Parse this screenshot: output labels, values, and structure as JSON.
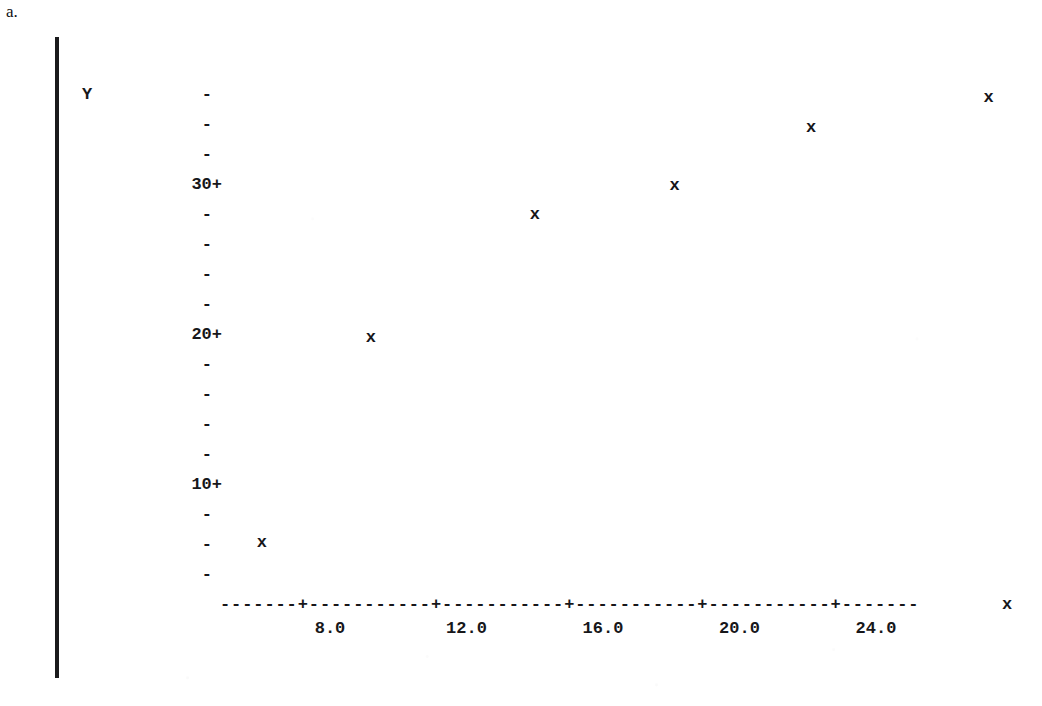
{
  "figure": {
    "panel_label": "a.",
    "y_axis_caption": "Y",
    "x_axis_end_label": "x",
    "x_axis_line": "-------+-----------+-----------+-----------+-----------+-------"
  },
  "chart_data": {
    "type": "scatter",
    "title": "",
    "subtitle": "",
    "xlabel": "x",
    "ylabel": "Y",
    "marker": "x",
    "grid": false,
    "legend": null,
    "xlim": [
      4.0,
      28.5
    ],
    "ylim": [
      2.0,
      37.0
    ],
    "x_ticks_major": [
      8.0,
      12.0,
      16.0,
      20.0,
      24.0
    ],
    "x_tick_labels": [
      "8.0",
      "12.0",
      "16.0",
      "20.0",
      "24.0"
    ],
    "y_ticks_major": [
      10,
      20,
      30
    ],
    "y_tick_labels": [
      "10+",
      "20+",
      "30+"
    ],
    "y_minor_tick_glyph": "-",
    "y_minor_ticks": [
      36,
      34,
      32,
      28,
      26,
      24,
      22,
      18,
      16,
      14,
      12,
      8,
      6,
      4
    ],
    "points": [
      {
        "x": 6.0,
        "y": 6.2
      },
      {
        "x": 9.2,
        "y": 19.9
      },
      {
        "x": 14.0,
        "y": 28.1
      },
      {
        "x": 18.1,
        "y": 30.0
      },
      {
        "x": 22.1,
        "y": 33.9
      },
      {
        "x": 27.3,
        "y": 35.9
      }
    ]
  },
  "colors": {
    "ink": "#17171a",
    "paper": "#ffffff",
    "rule": "#1a1a1c"
  }
}
